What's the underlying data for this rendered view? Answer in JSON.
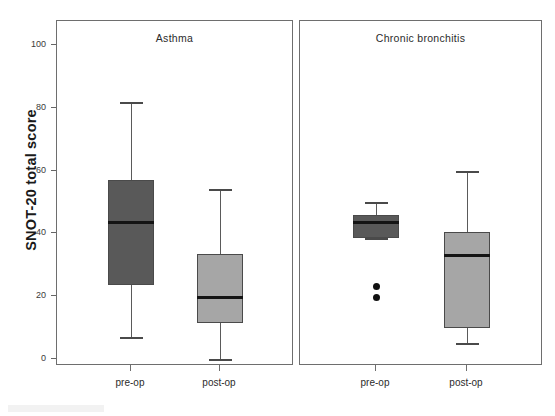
{
  "chart_data": {
    "type": "box",
    "title": "",
    "xlabel": "",
    "ylabel": "SNOT-20 total score",
    "ylim": [
      0,
      105
    ],
    "yticks": [
      0,
      20,
      40,
      60,
      80,
      100
    ],
    "ytick_labels": [
      "0",
      "20",
      "40",
      "60",
      "80",
      "100"
    ],
    "grid": false,
    "legend": "none",
    "panels": [
      {
        "label": "Asthma",
        "categories": [
          "pre-op",
          "post-op"
        ],
        "boxes": [
          {
            "name": "pre-op",
            "color": "#595959",
            "whisker_low": 7,
            "q1": 23.5,
            "median": 43.5,
            "q3": 57,
            "whisker_high": 82,
            "outliers": []
          },
          {
            "name": "post-op",
            "color": "#a6a6a6",
            "whisker_low": 0,
            "q1": 11.5,
            "median": 19.5,
            "q3": 33.5,
            "whisker_high": 54,
            "outliers": []
          }
        ]
      },
      {
        "label": "Chronic bronchitis",
        "categories": [
          "pre-op",
          "post-op"
        ],
        "boxes": [
          {
            "name": "pre-op",
            "color": "#595959",
            "whisker_low": 38.5,
            "q1": 38.5,
            "median": 43.5,
            "q3": 46,
            "whisker_high": 50,
            "outliers": [
              23,
              19.5
            ]
          },
          {
            "name": "post-op",
            "color": "#a6a6a6",
            "whisker_low": 5,
            "q1": 10,
            "median": 33,
            "q3": 40.5,
            "whisker_high": 60,
            "outliers": []
          }
        ]
      }
    ]
  },
  "axis": {
    "y_title": "SNOT-20 total score"
  },
  "colors": {
    "dark_box": "#595959",
    "light_box": "#a6a6a6",
    "median_line": "#141414",
    "frame": "#6e6e6e",
    "text": "#2b2b2b"
  }
}
